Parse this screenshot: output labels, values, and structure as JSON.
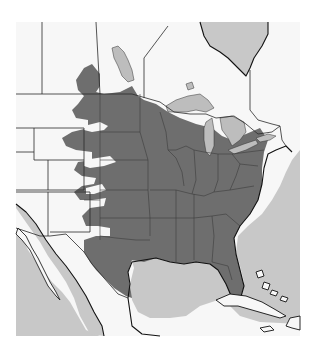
{
  "map": {
    "type": "species-range-map",
    "region": "North America (United States, southern Canada, northern Mexico, Caribbean)",
    "colors": {
      "range": "#6e6e6e",
      "land": "#f7f7f7",
      "water": "#c8c8c8",
      "lakes": "#bdbdbd",
      "borders": "#2a2a2a",
      "background": "#ffffff"
    },
    "legend": null,
    "labels": [],
    "range_description": "Shaded range covers central and eastern United States from the Great Plains (Dakotas, Nebraska, Kansas, Oklahoma, Texas) east to the Atlantic coast, including Florida and the Gulf Coast, extending north into southern Manitoba and the Great Lakes region",
    "features": {
      "great_lakes": [
        "Superior",
        "Michigan",
        "Huron",
        "Erie",
        "Ontario"
      ],
      "bodies_of_water": [
        "Gulf of Mexico",
        "Atlantic Ocean",
        "Pacific Ocean",
        "Gulf of California",
        "Hudson Bay (James Bay)",
        "Lake Winnipeg"
      ],
      "islands": [
        "Cuba",
        "Bahamas",
        "Hispaniola",
        "Jamaica"
      ]
    }
  }
}
